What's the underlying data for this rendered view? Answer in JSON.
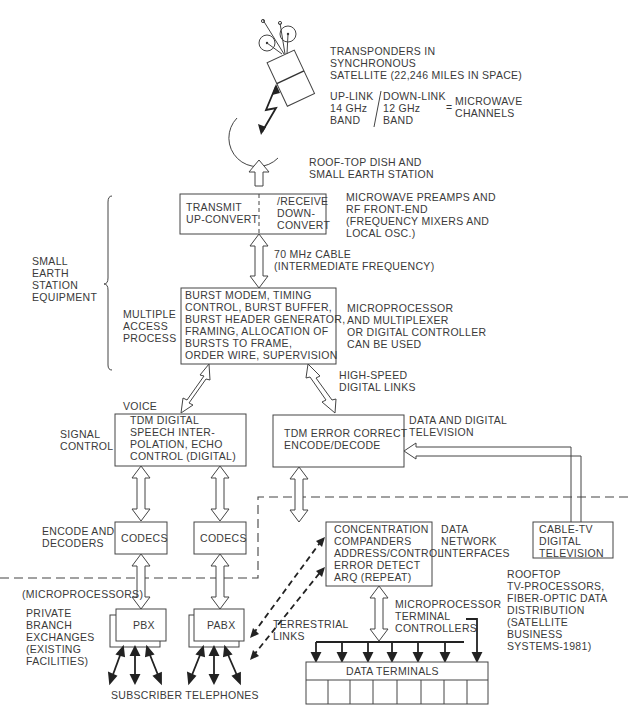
{
  "satellite": {
    "label_lines": [
      "TRANSPONDERS IN",
      "SYNCHRONOUS",
      "SATELLITE (22,246 MILES IN SPACE)"
    ],
    "uplink_lines": [
      "UP-LINK",
      "14 GHz",
      "BAND"
    ],
    "downlink_lines": [
      "DOWN-LINK",
      "12 GHz",
      "BAND"
    ],
    "equals": "=",
    "channels_lines": [
      "MICROWAVE",
      "CHANNELS"
    ]
  },
  "dish": {
    "label_lines": [
      "ROOF-TOP DISH AND",
      "SMALL EARTH STATION"
    ]
  },
  "rf_box": {
    "left_lines": [
      "TRANSMIT",
      "UP-CONVERT"
    ],
    "right_lines": [
      "/RECEIVE",
      "DOWN-",
      "CONVERT"
    ],
    "note_lines": [
      "MICROWAVE PREAMPS AND",
      "RF FRONT-END",
      "(FREQUENCY MIXERS AND",
      "LOCAL OSC.)"
    ]
  },
  "cable": {
    "label_lines": [
      "70 MHz CABLE",
      "(INTERMEDIATE FREQUENCY)"
    ]
  },
  "brace": {
    "label_lines": [
      "SMALL",
      "EARTH",
      "STATION",
      "EQUIPMENT"
    ]
  },
  "burst_box": {
    "side_label_lines": [
      "MULTIPLE",
      "ACCESS",
      "PROCESS"
    ],
    "lines": [
      "BURST MODEM, TIMING",
      "CONTROL, BURST BUFFER,",
      "BURST HEADER GENERATOR,",
      "FRAMING, ALLOCATION OF",
      "BURSTS TO FRAME,",
      "ORDER WIRE, SUPERVISION"
    ],
    "note_lines": [
      "MICROPROCESSOR",
      "AND MULTIPLEXER",
      "OR DIGITAL CONTROLLER",
      "CAN BE USED"
    ]
  },
  "high_speed": {
    "label_lines": [
      "HIGH-SPEED",
      "DIGITAL LINKS"
    ]
  },
  "voice_box": {
    "top_label": "VOICE",
    "side_label_lines": [
      "SIGNAL",
      "CONTROL"
    ],
    "lines": [
      "TDM DIGITAL",
      "SPEECH INTER-",
      "POLATION, ECHO",
      "CONTROL (DIGITAL)"
    ]
  },
  "error_box": {
    "lines": [
      "TDM ERROR CORRECT",
      "ENCODE/DECODE"
    ],
    "note_lines": [
      "DATA AND DIGITAL",
      "TELEVISION"
    ]
  },
  "codecs": {
    "side_label_lines": [
      "ENCODE AND",
      "DECODERS"
    ],
    "box1": "CODECS",
    "box2": "CODECS"
  },
  "concentration_box": {
    "lines": [
      "CONCENTRATION",
      "COMPANDERS",
      "ADDRESS/CONTROL",
      "ERROR DETECT",
      "ARQ (REPEAT)"
    ],
    "note_lines": [
      "DATA",
      "NETWORK",
      "INTERFACES"
    ]
  },
  "cable_tv_box": {
    "lines": [
      "CABLE-TV",
      "DIGITAL",
      "TELEVISION"
    ],
    "note_lines": [
      "ROOFTOP",
      "TV-PROCESSORS,",
      "FIBER-OPTIC DATA",
      "DISTRIBUTION",
      "(SATELLITE",
      "BUSINESS",
      "SYSTEMS-1981)"
    ]
  },
  "microprocessors_label": "(MICROPROCESSORS)",
  "pbx": {
    "side_label_lines": [
      "PRIVATE",
      "BRANCH",
      "EXCHANGES",
      "(EXISTING",
      "FACILITIES)"
    ],
    "box1": "PBX",
    "box2": "PABX",
    "terrestrial_lines": [
      "TERRESTRIAL",
      "LINKS"
    ],
    "telephones_label": "SUBSCRIBER TELEPHONES"
  },
  "terminals": {
    "controller_lines": [
      "MICROPROCESSOR",
      "TERMINAL",
      "CONTROLLERS"
    ],
    "label": "DATA TERMINALS",
    "cell_count": 8
  }
}
